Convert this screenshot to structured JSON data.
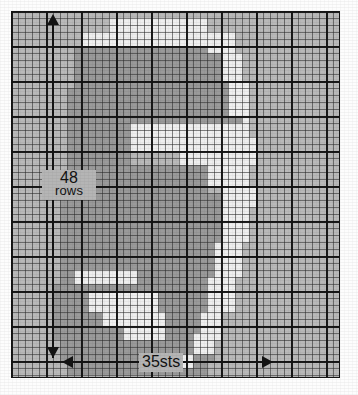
{
  "document": {
    "kind": "knitting-chart",
    "title": "Knitting / cross-stitch colourwork chart"
  },
  "annotations": {
    "rows_value": "48",
    "rows_unit": "rows",
    "stitches_label": "35sts",
    "vertical_arrow": "double-headed-vertical-arrow",
    "horizontal_arrow": "double-headed-horizontal-arrow",
    "side_note": ""
  },
  "palette": {
    "background_light": "#b9b9b9",
    "motif_mid": "#9a9a9a",
    "motif_light": "#efefef",
    "grid_thin": "#3a3a3a",
    "grid_thick": "#141414",
    "ink": "#121212"
  },
  "chart_data": {
    "type": "heatmap",
    "xlabel": "35sts",
    "ylabel": "48 rows",
    "grid": true,
    "legend_position": "none",
    "cols": 47,
    "rows": 53,
    "cell_px": 7,
    "value_colors": {
      "0": "#b9b9b9",
      "1": "#9a9a9a",
      "2": "#efefef"
    },
    "regions": [
      {
        "value": 2,
        "x": 14,
        "y": 1,
        "w": 14,
        "h": 2
      },
      {
        "value": 2,
        "x": 10,
        "y": 3,
        "w": 18,
        "h": 2
      },
      {
        "value": 1,
        "x": 9,
        "y": 5,
        "w": 21,
        "h": 3
      },
      {
        "value": 1,
        "x": 9,
        "y": 8,
        "w": 22,
        "h": 3
      },
      {
        "value": 2,
        "x": 28,
        "y": 3,
        "w": 4,
        "h": 3
      },
      {
        "value": 2,
        "x": 30,
        "y": 6,
        "w": 3,
        "h": 4
      },
      {
        "value": 1,
        "x": 8,
        "y": 11,
        "w": 24,
        "h": 4
      },
      {
        "value": 2,
        "x": 31,
        "y": 10,
        "w": 3,
        "h": 6
      },
      {
        "value": 1,
        "x": 8,
        "y": 15,
        "w": 25,
        "h": 3
      },
      {
        "value": 2,
        "x": 17,
        "y": 16,
        "w": 17,
        "h": 2
      },
      {
        "value": 2,
        "x": 17,
        "y": 18,
        "w": 18,
        "h": 2
      },
      {
        "value": 1,
        "x": 8,
        "y": 18,
        "w": 9,
        "h": 4
      },
      {
        "value": 2,
        "x": 24,
        "y": 20,
        "w": 11,
        "h": 2
      },
      {
        "value": 1,
        "x": 8,
        "y": 22,
        "w": 20,
        "h": 4
      },
      {
        "value": 2,
        "x": 28,
        "y": 22,
        "w": 6,
        "h": 3
      },
      {
        "value": 2,
        "x": 30,
        "y": 25,
        "w": 5,
        "h": 3
      },
      {
        "value": 1,
        "x": 7,
        "y": 26,
        "w": 23,
        "h": 5
      },
      {
        "value": 2,
        "x": 30,
        "y": 28,
        "w": 4,
        "h": 5
      },
      {
        "value": 1,
        "x": 7,
        "y": 31,
        "w": 23,
        "h": 4
      },
      {
        "value": 2,
        "x": 29,
        "y": 33,
        "w": 4,
        "h": 5
      },
      {
        "value": 1,
        "x": 7,
        "y": 35,
        "w": 22,
        "h": 4
      },
      {
        "value": 2,
        "x": 9,
        "y": 37,
        "w": 9,
        "h": 2
      },
      {
        "value": 2,
        "x": 7,
        "y": 39,
        "w": 12,
        "h": 2
      },
      {
        "value": 1,
        "x": 6,
        "y": 39,
        "w": 23,
        "h": 4
      },
      {
        "value": 2,
        "x": 11,
        "y": 40,
        "w": 10,
        "h": 3
      },
      {
        "value": 2,
        "x": 28,
        "y": 38,
        "w": 4,
        "h": 5
      },
      {
        "value": 1,
        "x": 6,
        "y": 43,
        "w": 24,
        "h": 4
      },
      {
        "value": 2,
        "x": 13,
        "y": 43,
        "w": 9,
        "h": 2
      },
      {
        "value": 2,
        "x": 16,
        "y": 45,
        "w": 6,
        "h": 2
      },
      {
        "value": 2,
        "x": 27,
        "y": 43,
        "w": 3,
        "h": 4
      },
      {
        "value": 1,
        "x": 7,
        "y": 47,
        "w": 22,
        "h": 3
      },
      {
        "value": 2,
        "x": 26,
        "y": 46,
        "w": 3,
        "h": 3
      },
      {
        "value": 1,
        "x": 8,
        "y": 50,
        "w": 20,
        "h": 2
      },
      {
        "value": 2,
        "x": 24,
        "y": 49,
        "w": 2,
        "h": 2
      }
    ]
  }
}
